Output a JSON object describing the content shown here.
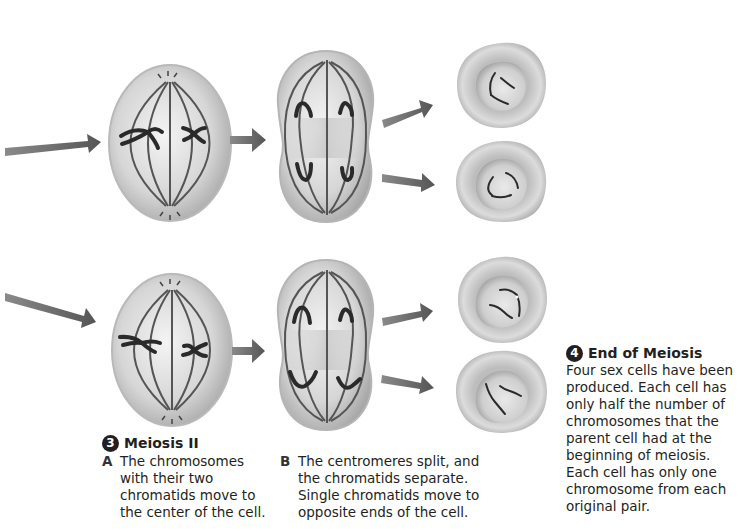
{
  "diagram": {
    "title": "Meiosis II",
    "colors": {
      "arrow": "#5a5a5a",
      "cell_light": "#f1f1f1",
      "cell_mid": "#c8c8c8",
      "cell_dark": "#9a9a9a",
      "spindle": "#555555",
      "chromosome": "#2a2a2a",
      "step_badge": "#231f20"
    },
    "rows": [
      {
        "name": "top-row",
        "stages": [
          "metaphase-ii-cell",
          "anaphase-ii-cell",
          "sex-cell",
          "sex-cell"
        ]
      },
      {
        "name": "bottom-row",
        "stages": [
          "metaphase-ii-cell",
          "anaphase-ii-cell",
          "sex-cell",
          "sex-cell"
        ]
      }
    ]
  },
  "step3": {
    "number": "3",
    "heading": "Meiosis II",
    "a": {
      "letter": "A",
      "lines": [
        "The chromosomes",
        "with their two",
        "chromatids move to",
        "the center of the cell."
      ]
    },
    "b": {
      "letter": "B",
      "lines": [
        "The centromeres split, and",
        "the chromatids separate.",
        "Single chromatids move to",
        "opposite ends of the cell."
      ]
    }
  },
  "step4": {
    "number": "4",
    "heading": "End of Meiosis",
    "lines": [
      "Four sex cells have been",
      "produced. Each cell has",
      "only half the number of",
      "chromosomes that the",
      "parent cell had at the",
      "beginning of meiosis.",
      "Each cell has only one",
      "chromosome from each",
      "original pair."
    ]
  }
}
